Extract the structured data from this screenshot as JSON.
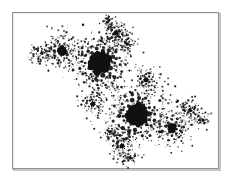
{
  "figure": {
    "domain": "chart",
    "caption": "",
    "background_color": "#ffffff",
    "ink_color": "#111111",
    "frame": {
      "label": "figure-border",
      "x": 12,
      "y": 12,
      "width": 209,
      "height": 159,
      "stroke_color": "#888888",
      "shadow_color": "#b9b9b9",
      "stroke_width": 1
    }
  },
  "chart_data": {
    "type": "scatter",
    "title": "",
    "subtitle": "",
    "xlabel": "",
    "ylabel": "",
    "grid": false,
    "legend": null,
    "axis_ticks": [],
    "xlim": [
      12,
      221
    ],
    "ylim": [
      12,
      171
    ],
    "point_color": "#111111",
    "clusters": [
      {
        "name": "primary-bulb-upper",
        "cx": 100,
        "cy": 63,
        "core_r": 9.2,
        "arms": 9,
        "rings": [
          {
            "radius": 13.5,
            "count": 14,
            "dot_r": 1.9,
            "phase": 0
          },
          {
            "radius": 18.0,
            "count": 18,
            "dot_r": 1.5,
            "phase": 0.18
          },
          {
            "radius": 23.0,
            "count": 20,
            "dot_r": 1.1,
            "phase": 0.36
          },
          {
            "radius": 28.0,
            "count": 18,
            "dot_r": 0.85,
            "phase": 0.54
          }
        ]
      },
      {
        "name": "primary-bulb-lower",
        "cx": 137,
        "cy": 115,
        "core_r": 9.0,
        "arms": 9,
        "rings": [
          {
            "radius": 13.5,
            "count": 14,
            "dot_r": 1.9,
            "phase": 0.2
          },
          {
            "radius": 18.0,
            "count": 18,
            "dot_r": 1.5,
            "phase": 0.38
          },
          {
            "radius": 23.0,
            "count": 20,
            "dot_r": 1.1,
            "phase": 0.56
          },
          {
            "radius": 28.5,
            "count": 18,
            "dot_r": 0.85,
            "phase": 0.74
          }
        ]
      },
      {
        "name": "secondary-bulb-upper-left",
        "cx": 62,
        "cy": 51,
        "core_r": 4.2,
        "arms": 7,
        "rings": [
          {
            "radius": 7.5,
            "count": 10,
            "dot_r": 1.4,
            "phase": 0.1
          },
          {
            "radius": 11.5,
            "count": 13,
            "dot_r": 1.0,
            "phase": 0.3
          },
          {
            "radius": 15.5,
            "count": 14,
            "dot_r": 0.75,
            "phase": 0.5
          }
        ]
      },
      {
        "name": "secondary-bulb-lower-right",
        "cx": 172,
        "cy": 128,
        "core_r": 4.2,
        "arms": 7,
        "rings": [
          {
            "radius": 7.5,
            "count": 10,
            "dot_r": 1.4,
            "phase": 0.25
          },
          {
            "radius": 11.5,
            "count": 13,
            "dot_r": 1.0,
            "phase": 0.45
          },
          {
            "radius": 15.5,
            "count": 14,
            "dot_r": 0.75,
            "phase": 0.65
          }
        ]
      },
      {
        "name": "satellite-top",
        "cx": 116,
        "cy": 33,
        "core_r": 2.4,
        "arms": 6,
        "rings": [
          {
            "radius": 5.5,
            "count": 9,
            "dot_r": 1.1,
            "phase": 0.15
          },
          {
            "radius": 9.5,
            "count": 11,
            "dot_r": 0.8,
            "phase": 0.4
          }
        ]
      },
      {
        "name": "satellite-mid-left",
        "cx": 93,
        "cy": 104,
        "core_r": 2.3,
        "arms": 6,
        "rings": [
          {
            "radius": 5.5,
            "count": 9,
            "dot_r": 1.0,
            "phase": 0.3
          },
          {
            "radius": 9.0,
            "count": 11,
            "dot_r": 0.75,
            "phase": 0.55
          }
        ]
      },
      {
        "name": "satellite-mid-right",
        "cx": 146,
        "cy": 80,
        "core_r": 2.3,
        "arms": 6,
        "rings": [
          {
            "radius": 5.5,
            "count": 9,
            "dot_r": 1.0,
            "phase": 0.2
          },
          {
            "radius": 9.0,
            "count": 11,
            "dot_r": 0.75,
            "phase": 0.48
          }
        ]
      },
      {
        "name": "satellite-bottom",
        "cx": 122,
        "cy": 146,
        "core_r": 2.3,
        "arms": 6,
        "rings": [
          {
            "radius": 5.5,
            "count": 9,
            "dot_r": 1.0,
            "phase": 0.35
          },
          {
            "radius": 9.0,
            "count": 10,
            "dot_r": 0.7,
            "phase": 0.6
          }
        ]
      },
      {
        "name": "satellite-far-right",
        "cx": 190,
        "cy": 110,
        "core_r": 1.7,
        "arms": 5,
        "rings": [
          {
            "radius": 4.5,
            "count": 8,
            "dot_r": 0.85,
            "phase": 0.1
          },
          {
            "radius": 7.5,
            "count": 9,
            "dot_r": 0.65,
            "phase": 0.45
          }
        ]
      },
      {
        "name": "satellite-far-left",
        "cx": 42,
        "cy": 53,
        "core_r": 1.5,
        "arms": 5,
        "rings": [
          {
            "radius": 4.0,
            "count": 8,
            "dot_r": 0.8,
            "phase": 0.22
          },
          {
            "radius": 7.0,
            "count": 9,
            "dot_r": 0.6,
            "phase": 0.5
          }
        ]
      },
      {
        "name": "satellite-upper-right-tip",
        "cx": 127,
        "cy": 44,
        "core_r": 1.4,
        "arms": 5,
        "rings": [
          {
            "radius": 3.8,
            "count": 7,
            "dot_r": 0.7,
            "phase": 0.3
          }
        ]
      },
      {
        "name": "satellite-lower-left-tip",
        "cx": 110,
        "cy": 132,
        "core_r": 1.3,
        "arms": 5,
        "rings": [
          {
            "radius": 3.6,
            "count": 7,
            "dot_r": 0.65,
            "phase": 0.4
          }
        ]
      },
      {
        "name": "satellite-right-edge",
        "cx": 203,
        "cy": 120,
        "core_r": 1.2,
        "arms": 4,
        "rings": [
          {
            "radius": 3.2,
            "count": 6,
            "dot_r": 0.6,
            "phase": 0.15
          }
        ]
      },
      {
        "name": "satellite-bottom-tail",
        "cx": 130,
        "cy": 158,
        "core_r": 1.0,
        "arms": 4,
        "rings": [
          {
            "radius": 3.0,
            "count": 6,
            "dot_r": 0.55,
            "phase": 0.5
          }
        ]
      },
      {
        "name": "satellite-top-tail",
        "cx": 107,
        "cy": 22,
        "core_r": 1.0,
        "arms": 4,
        "rings": [
          {
            "radius": 2.8,
            "count": 6,
            "dot_r": 0.5,
            "phase": 0.2
          }
        ]
      }
    ],
    "dust": {
      "count": 620,
      "seed": 20240517,
      "spread": 7.5,
      "dot_r_min": 0.35,
      "dot_r_max": 1.25,
      "note": "speckle scattered along the diagonal spine and around each cluster, emulating print halftone noise"
    }
  }
}
